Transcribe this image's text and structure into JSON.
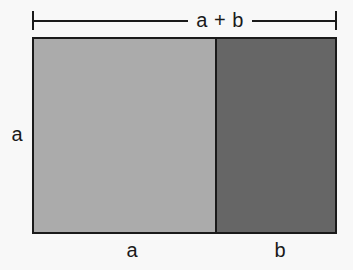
{
  "figure": {
    "type": "geometric-area-diagram",
    "colors": {
      "background": "#f8f8f8",
      "stroke": "#1a1a1a",
      "region_a_fill": "#ababab",
      "region_b_fill": "#666666",
      "text": "#1a1a1a"
    },
    "top_dimension": {
      "label": "a + b",
      "tick_style": "end-ticks"
    },
    "left_dimension": {
      "label": "a"
    },
    "regions": [
      {
        "id": "region-a",
        "bottom_label": "a",
        "fill": "#ababab",
        "width_fraction": 0.6
      },
      {
        "id": "region-b",
        "bottom_label": "b",
        "fill": "#666666",
        "width_fraction": 0.4
      }
    ],
    "bottom_labels": {
      "left": "a",
      "right": "b"
    }
  }
}
